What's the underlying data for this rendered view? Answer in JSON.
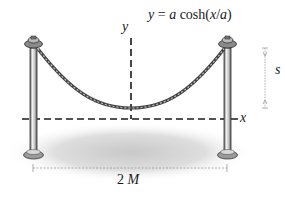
{
  "diagram": {
    "equation": {
      "lhs": "y",
      "eq": " = ",
      "a1": "a",
      "func": " cosh(",
      "x": "x",
      "slash": "/",
      "a2": "a",
      "close": ")"
    },
    "axes": {
      "y_label": "y",
      "x_label": "x"
    },
    "dimensions": {
      "sag_label": "s",
      "span_number": "2",
      "span_var": "M"
    },
    "colors": {
      "ink": "#1a1a1a",
      "post_fill": "#cfcfcf",
      "rope": "#555555",
      "shadow": "#d6d6d6",
      "dim_line": "#9a9a9a"
    }
  }
}
